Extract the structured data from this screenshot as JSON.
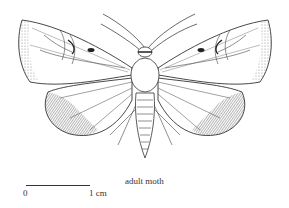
{
  "figure": {
    "caption": "adult moth"
  },
  "scale_bar": {
    "start_label": "0",
    "end_label": "1 cm"
  }
}
